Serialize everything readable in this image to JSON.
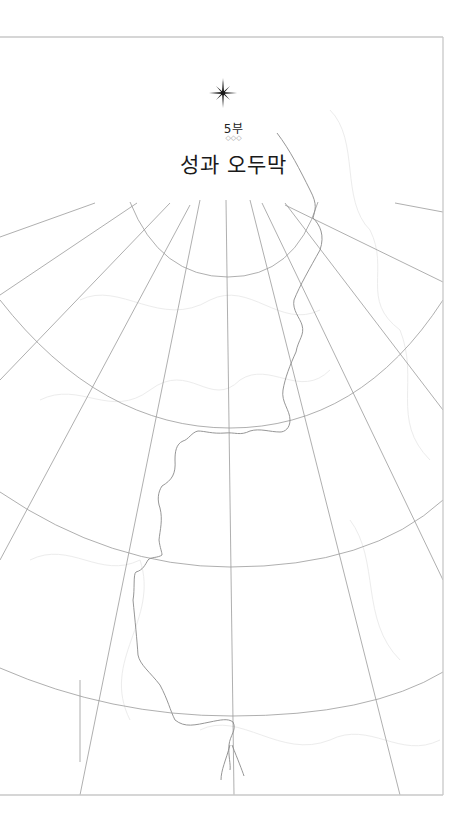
{
  "page": {
    "part_label": "5부",
    "ornament": "◇◇◇",
    "title": "성과 오두막",
    "icons": {
      "compass_star": "compass-star-icon"
    },
    "colors": {
      "frame": "#c8c8c8",
      "grid_lines": "#9a9a9a",
      "border_line": "#8a8a8a",
      "faint_contours": "#ececec",
      "title_text": "#1a1a1a"
    }
  }
}
